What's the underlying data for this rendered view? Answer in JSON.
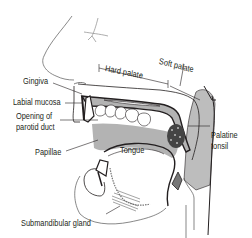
{
  "diagram": {
    "labels": {
      "gingiva": "Gingiva",
      "labial_mucosa": "Labial mucosa",
      "parotid_line1": "Opening of",
      "parotid_line2": "parotid duct",
      "papillae": "Papillae",
      "tongue": "Tongue",
      "submandibular": "Submandibular gland",
      "hard_palate": "Hard palate",
      "soft_palate": "Soft palate",
      "palatine_line1": "Palatine",
      "palatine_line2": "tonsil"
    },
    "colors": {
      "outline": "#231f20",
      "tissue_gray": "#b3b3b3",
      "pharynx_gray": "#bdbdbd",
      "tooth_white": "#ffffff",
      "background": "#ffffff"
    }
  }
}
